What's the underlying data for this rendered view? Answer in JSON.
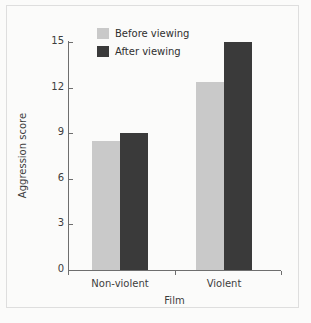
{
  "chart_data": {
    "type": "bar",
    "title": "",
    "subtitle": "",
    "xlabel": "Film",
    "ylabel": "Aggression score",
    "categories": [
      "Non-violent",
      "Violent"
    ],
    "series": [
      {
        "name": "Before viewing",
        "values": [
          8.5,
          12.4
        ],
        "color": "#c9c9c9"
      },
      {
        "name": "After viewing",
        "values": [
          9.0,
          15.0
        ],
        "color": "#3a3a3a"
      }
    ],
    "ylim": [
      0,
      15
    ],
    "yticks": [
      0,
      3,
      6,
      9,
      12,
      15
    ],
    "ytick_labels": [
      "0",
      "3",
      "6",
      "9",
      "12",
      "15"
    ],
    "grid": false,
    "legend_position": "top-left-inside",
    "annotations": []
  },
  "figure": {
    "background_color": "#fbfbfa",
    "axis_color": "#6e6e6e",
    "text_color": "#3d3d3d"
  }
}
